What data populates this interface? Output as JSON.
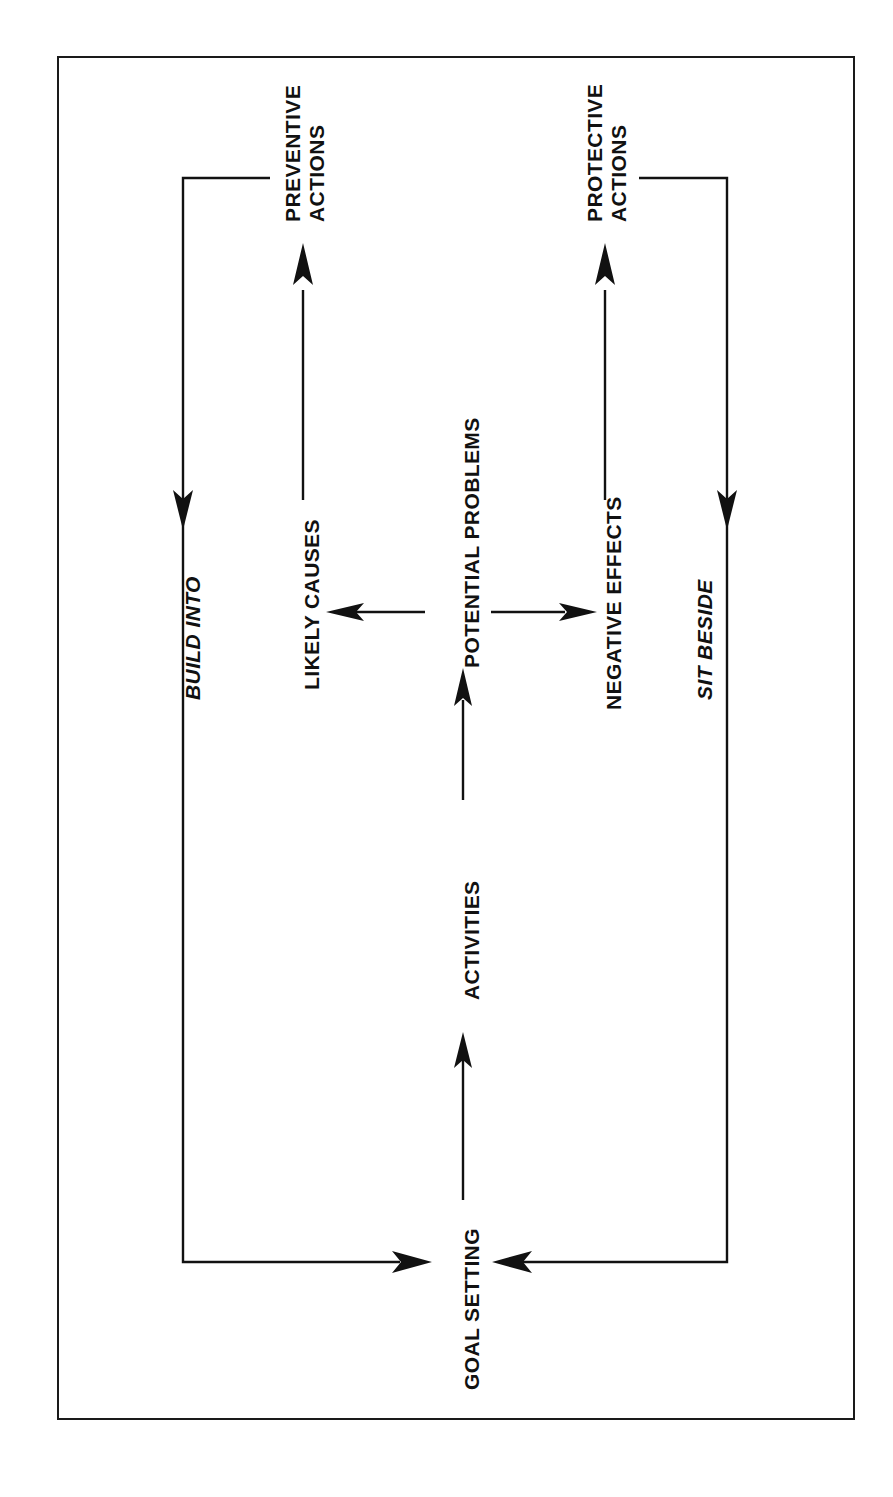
{
  "page": {
    "width": 893,
    "height": 1497,
    "background_color": "#ffffff",
    "frame_color": "#1a1a1a",
    "ink_color": "#111111",
    "orientation_note": "diagram printed sideways (rotated 90 degrees counter-clockwise)"
  },
  "diagram": {
    "title": "",
    "type": "flow-cycle",
    "nodes": [
      {
        "id": "goal_setting",
        "label": "GOAL SETTING",
        "style": "upright"
      },
      {
        "id": "activities",
        "label": "ACTIVITIES",
        "style": "upright"
      },
      {
        "id": "potential_problems",
        "label": "POTENTIAL PROBLEMS",
        "style": "upright"
      },
      {
        "id": "likely_causes",
        "label": "LIKELY CAUSES",
        "style": "upright"
      },
      {
        "id": "negative_effects",
        "label": "NEGATIVE EFFECTS",
        "style": "upright"
      },
      {
        "id": "preventive_actions",
        "label": "PREVENTIVE ACTIONS",
        "line1": "PREVENTIVE",
        "line2": "ACTIONS",
        "style": "upright"
      },
      {
        "id": "protective_actions",
        "label": "PROTECTIVE ACTIONS",
        "line1": "PROTECTIVE",
        "line2": "ACTIONS",
        "style": "upright"
      }
    ],
    "edge_labels": [
      {
        "id": "build_into",
        "label": "BUILD INTO",
        "style": "italic"
      },
      {
        "id": "sit_beside",
        "label": "SIT BESIDE",
        "style": "italic"
      }
    ],
    "edges": [
      {
        "from": "goal_setting",
        "to": "activities",
        "label": "",
        "arrow": "single"
      },
      {
        "from": "activities",
        "to": "potential_problems",
        "label": "",
        "arrow": "single"
      },
      {
        "from": "potential_problems",
        "to": "likely_causes",
        "label": "",
        "arrow": "single"
      },
      {
        "from": "potential_problems",
        "to": "negative_effects",
        "label": "",
        "arrow": "single"
      },
      {
        "from": "likely_causes",
        "to": "preventive_actions",
        "label": "",
        "arrow": "single"
      },
      {
        "from": "negative_effects",
        "to": "protective_actions",
        "label": "",
        "arrow": "single"
      },
      {
        "from": "preventive_actions",
        "to": "goal_setting",
        "label": "BUILD INTO",
        "arrow": "single"
      },
      {
        "from": "protective_actions",
        "to": "goal_setting",
        "label": "SIT BESIDE",
        "arrow": "single"
      }
    ]
  }
}
